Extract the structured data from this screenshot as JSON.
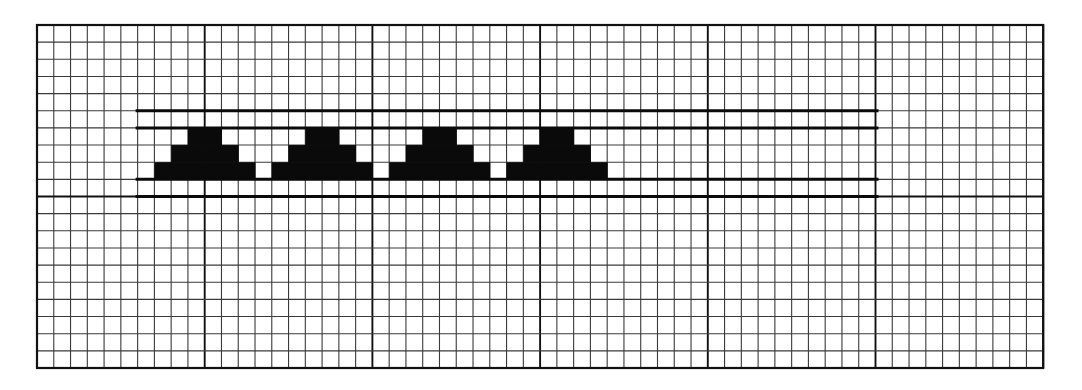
{
  "diagram": {
    "type": "grid-paper-pattern",
    "grid": {
      "origin_px": [
        37,
        25
      ],
      "cell_w_px": 16.77,
      "cell_h_px": 17.15,
      "cols": 60,
      "rows": 20,
      "major_every": 10,
      "line_color": "#3a3a3a",
      "major_color": "#111111"
    },
    "band": {
      "col_start": 6,
      "col_end": 50,
      "rows": [
        5,
        6,
        9,
        10
      ],
      "color": "#0a0a0a"
    },
    "motif": {
      "name": "stepped-triangle",
      "rows": [
        {
          "row": 6,
          "col_offset": 2,
          "width": 2
        },
        {
          "row": 7,
          "col_offset": 1,
          "width": 4
        },
        {
          "row": 8,
          "col_offset": 0,
          "width": 6
        }
      ],
      "starts": [
        7,
        14,
        21,
        28
      ],
      "fill": "#0a0a0a"
    }
  }
}
